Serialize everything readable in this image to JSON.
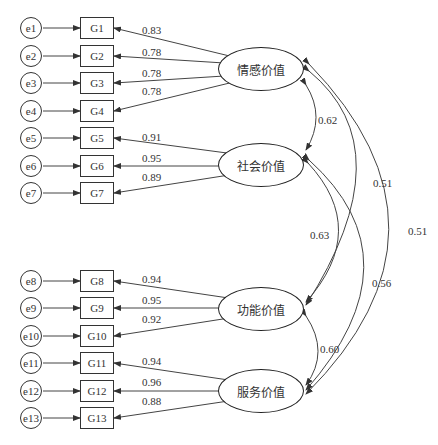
{
  "diagram": {
    "type": "structural-equation-model",
    "errors": [
      "e1",
      "e2",
      "e3",
      "e4",
      "e5",
      "e6",
      "e7",
      "e8",
      "e9",
      "e10",
      "e11",
      "e12",
      "e13"
    ],
    "indicators": [
      "G1",
      "G2",
      "G3",
      "G4",
      "G5",
      "G6",
      "G7",
      "G8",
      "G9",
      "G10",
      "G11",
      "G12",
      "G13"
    ],
    "latents": [
      {
        "id": "emotional",
        "label": "情感价值",
        "indicators": [
          "G1",
          "G2",
          "G3",
          "G4"
        ],
        "loadings": [
          "0.83",
          "0.78",
          "0.78",
          "0.78"
        ]
      },
      {
        "id": "social",
        "label": "社会价值",
        "indicators": [
          "G5",
          "G6",
          "G7"
        ],
        "loadings": [
          "0.91",
          "0.95",
          "0.89"
        ]
      },
      {
        "id": "functional",
        "label": "功能价值",
        "indicators": [
          "G8",
          "G9",
          "G10"
        ],
        "loadings": [
          "0.94",
          "0.95",
          "0.92"
        ]
      },
      {
        "id": "service",
        "label": "服务价值",
        "indicators": [
          "G11",
          "G12",
          "G13"
        ],
        "loadings": [
          "0.94",
          "0.96",
          "0.88"
        ]
      }
    ],
    "loading_labels": [
      "0.83",
      "0.78",
      "0.78",
      "0.78",
      "0.91",
      "0.95",
      "0.89",
      "0.94",
      "0.95",
      "0.92",
      "0.94",
      "0.96",
      "0.88"
    ],
    "correlations": [
      {
        "from": "情感价值",
        "to": "社会价值",
        "value": "0.62"
      },
      {
        "from": "社会价值",
        "to": "功能价值",
        "value": "0.63"
      },
      {
        "from": "情感价值",
        "to": "功能价值",
        "value": "0.51"
      },
      {
        "from": "社会价值",
        "to": "服务价值",
        "value": "0.56"
      },
      {
        "from": "情感价值",
        "to": "服务价值",
        "value": "0.51"
      },
      {
        "from": "功能价值",
        "to": "服务价值",
        "value": "0.60"
      }
    ]
  }
}
